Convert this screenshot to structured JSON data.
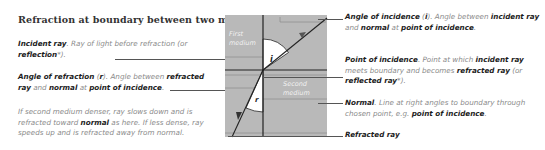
{
  "title": "Refraction at boundary between two media",
  "title_marker": "*",
  "left_notes": [
    {
      "term": "Incident ray",
      "text_1": ". Ray of light before refraction (or ",
      "bold_1": "reflection",
      "text_2": "*)."
    },
    {
      "term": "Angle of refraction",
      "symbol": "r",
      "text_1": "). Angle between ",
      "bold_1": "refracted ray",
      "text_2": " and ",
      "bold_2": "normal",
      "text_3": " at ",
      "bold_3": "point of incidence",
      "text_4": "."
    },
    {
      "text_1": "If second medium denser, ray slows down and is refracted toward ",
      "bold_1": "normal",
      "text_2": " as here. If less dense, ray speeds up and is refracted away from normal."
    }
  ],
  "right_notes": [
    {
      "term": "Angle of incidence",
      "symbol": "i",
      "text_1": "). Angle between ",
      "bold_1": "incident ray",
      "text_2": " and ",
      "bold_2": "normal",
      "text_3": " at ",
      "bold_3": "point of incidence",
      "text_4": "."
    },
    {
      "term": "Point of incidence",
      "text_1": ". Point at which ",
      "bold_1": "incident ray",
      "text_2": " meets boundary and becomes ",
      "bold_2": "refracted ray",
      "text_3": " (or ",
      "bold_3": "reflected ray",
      "text_4": "*)."
    },
    {
      "term": "Normal",
      "text_1": ". Line at right angles to boundary through chosen point, e.g. ",
      "bold_1": "point of incidence",
      "text_2": "."
    },
    {
      "term": "Refracted ray"
    }
  ],
  "diagram": {
    "first_medium_label_1": "First",
    "first_medium_label_2": "medium",
    "second_medium_label_1": "Second",
    "second_medium_label_2": "medium",
    "angle_i": "i",
    "angle_r": "r",
    "colors": {
      "medium_fill": "#b9b9b9",
      "angle_fill": "#ffffff",
      "line": "#222222",
      "light_line": "#8f8f8f"
    }
  }
}
